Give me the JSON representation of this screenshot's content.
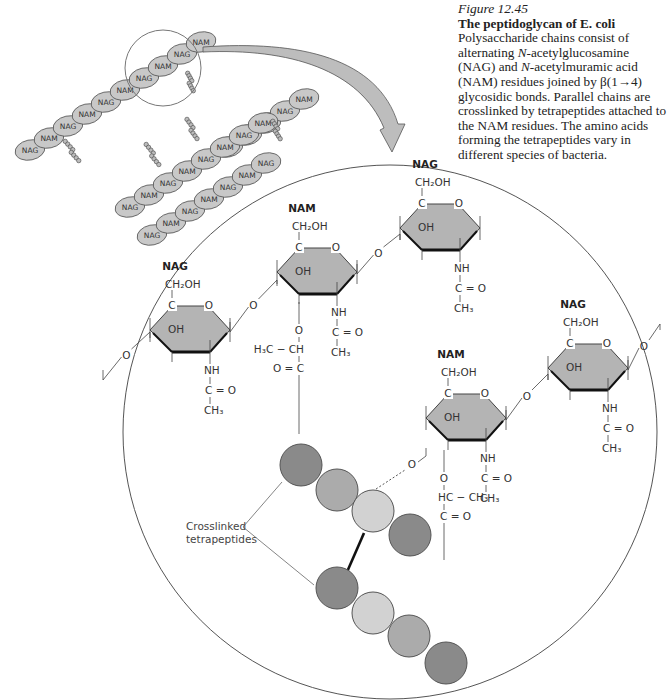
{
  "caption": {
    "figure_number": "Figure 12.45",
    "title": "The peptidoglycan of E. coli",
    "body_1": "Polysaccharide chains consist of alternating ",
    "nag_prefix": "N",
    "nag_name": "-acetylglucosamine (NAG) and ",
    "nam_prefix": "N",
    "nam_name": "-acetylmuramic acid (NAM) residues joined by β(1→4) glycosidic bonds. Parallel chains are crosslinked by tetrapeptides attached to the NAM residues. The amino acids forming the tetrapeptides vary in different species of bacteria."
  },
  "schematic": {
    "residue_labels": [
      "NAG",
      "NAM"
    ],
    "colors": {
      "residue_fill": "#c8c8c8",
      "residue_stroke": "#555555",
      "arrow_fill": "#bdbdbd"
    }
  },
  "detail": {
    "sugar_labels": {
      "nag": "NAG",
      "nam": "NAM"
    },
    "groups": {
      "ch2oh": "CH₂OH",
      "c": "C",
      "o": "O",
      "oh": "OH",
      "nh": "NH",
      "c_eq_o": "C = O",
      "ch3": "CH₃",
      "h3c_ch": "H₃C − CH",
      "o_eq_c": "O = C",
      "hc_ch3": "HC − CH₃"
    },
    "annotation_line1": "Crosslinked",
    "annotation_line2": "tetrapeptides",
    "colors": {
      "ring_fill": "#b4b4b4",
      "peptide_dark": "#8a8a8a",
      "peptide_mid": "#ababab",
      "peptide_light": "#d2d2d2",
      "circle_stroke": "#555555"
    }
  }
}
